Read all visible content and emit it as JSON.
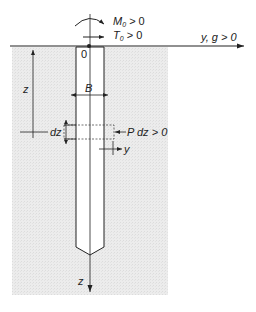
{
  "figure": {
    "labels": {
      "moment": "M",
      "moment_sub": "0",
      "moment_cond": " > 0",
      "shear": "T",
      "shear_sub": "0",
      "shear_cond": " > 0",
      "y_axis": "y, g > 0",
      "origin": "0",
      "depth": "z",
      "width": "B",
      "element_height": "dz",
      "soil_reaction": "P dz > 0",
      "deflection": "y",
      "z_axis": "z"
    },
    "colors": {
      "soil": "#ececec",
      "lines": "#222222",
      "pile": "#ffffff"
    }
  }
}
